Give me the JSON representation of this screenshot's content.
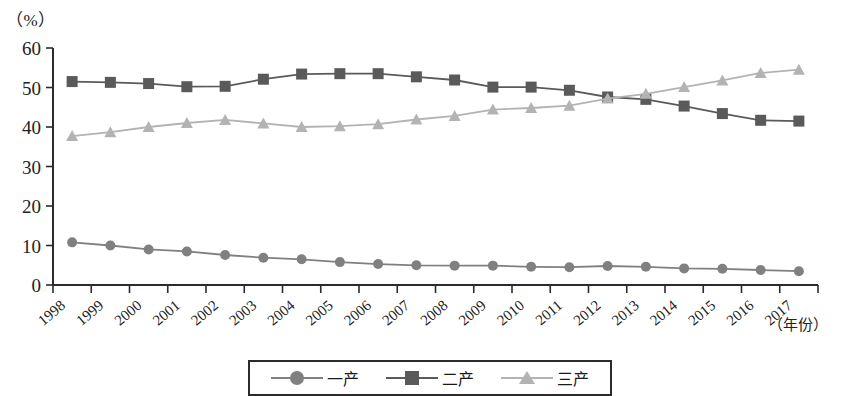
{
  "chart_data": {
    "type": "line",
    "title": "",
    "xlabel": "（年份）",
    "ylabel": "（%）",
    "ylim": [
      0,
      60
    ],
    "yticks": [
      0,
      10,
      20,
      30,
      40,
      50,
      60
    ],
    "grid": false,
    "legend_position": "bottom",
    "categories": [
      "1998",
      "1999",
      "2000",
      "2001",
      "2002",
      "2003",
      "2004",
      "2005",
      "2006",
      "2007",
      "2008",
      "2009",
      "2010",
      "2011",
      "2012",
      "2013",
      "2014",
      "2015",
      "2016",
      "2017"
    ],
    "series": [
      {
        "name": "一产",
        "marker": "circle",
        "color": "#808080",
        "values": [
          10.8,
          10.0,
          9.0,
          8.5,
          7.6,
          6.9,
          6.5,
          5.8,
          5.3,
          5.0,
          4.9,
          4.9,
          4.6,
          4.5,
          4.8,
          4.6,
          4.2,
          4.1,
          3.8,
          3.5
        ]
      },
      {
        "name": "二产",
        "marker": "square",
        "color": "#5a5a5a",
        "values": [
          51.5,
          51.3,
          51.0,
          50.2,
          50.3,
          52.1,
          53.4,
          53.5,
          53.5,
          52.7,
          51.9,
          50.1,
          50.1,
          49.3,
          47.6,
          47.0,
          45.3,
          43.4,
          41.7,
          41.5
        ]
      },
      {
        "name": "三产",
        "marker": "triangle",
        "color": "#b3b3b3",
        "values": [
          37.7,
          38.7,
          40.0,
          41.0,
          41.8,
          40.9,
          40.0,
          40.2,
          40.7,
          41.9,
          42.8,
          44.4,
          44.8,
          45.4,
          47.2,
          48.4,
          50.1,
          51.8,
          53.7,
          54.5
        ]
      }
    ]
  },
  "legend": {
    "entries": [
      {
        "label": "一产",
        "marker": "circle-marker-icon"
      },
      {
        "label": "二产",
        "marker": "square-marker-icon"
      },
      {
        "label": "三产",
        "marker": "triangle-marker-icon"
      }
    ]
  },
  "axes": {
    "y_unit": "（%）",
    "x_unit": "（年份）"
  }
}
